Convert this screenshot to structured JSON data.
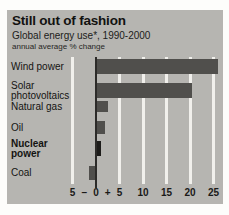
{
  "header": {
    "title": "Still out of fashion",
    "subtitle": "Global energy use*, 1990-2000",
    "note": "annual average % change"
  },
  "colors": {
    "page_bg": "#fdfdfb",
    "panel_bg": "#b6b5b1",
    "bar": "#504f4c",
    "bar_highlight": "#1d1c1a",
    "gridline": "#f1f0ec",
    "zero_line": "#2c2b29",
    "text": "#141412"
  },
  "chart_data": {
    "type": "bar",
    "orientation": "horizontal",
    "title": "Still out of fashion",
    "subtitle": "Global energy use*, 1990-2000",
    "unit_note": "annual average % change",
    "categories": [
      "Wind power",
      "Solar photovoltaics",
      "Natural gas",
      "Oil",
      "Nuclear power",
      "Coal"
    ],
    "values": [
      26,
      20.5,
      2.5,
      2,
      1,
      -1.5
    ],
    "highlighted_category": "Nuclear power",
    "x_ticks": [
      -5,
      0,
      5,
      10,
      15,
      20,
      25
    ],
    "x_tick_labels": [
      "5",
      "0",
      "5",
      "10",
      "15",
      "20",
      "25"
    ],
    "sign_labels": {
      "minus": "–",
      "plus": "+"
    },
    "xlim": [
      -5,
      27
    ],
    "grid": true,
    "legend": false,
    "xlabel": "",
    "ylabel": ""
  }
}
